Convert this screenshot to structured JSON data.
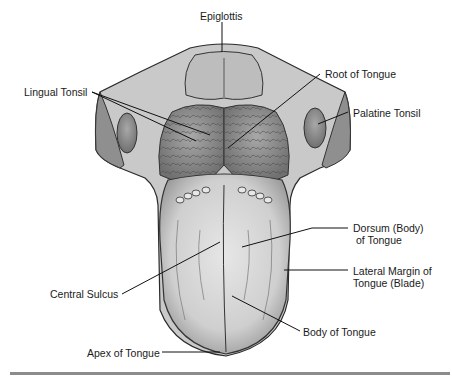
{
  "figure": {
    "labels": [
      {
        "id": "epiglottis",
        "text": "Epiglottis",
        "x": 200,
        "y": 17
      },
      {
        "id": "lingual-tonsil",
        "text": "Lingual Tonsil",
        "x": 24,
        "y": 86
      },
      {
        "id": "root-of-tongue",
        "text": "Root of Tongue",
        "x": 325,
        "y": 68
      },
      {
        "id": "palatine-tonsil",
        "text": "Palatine Tonsil",
        "x": 353,
        "y": 107
      },
      {
        "id": "dorsum",
        "text": "Dorsum (Body)\n of Tongue",
        "x": 353,
        "y": 222
      },
      {
        "id": "lateral-margin",
        "text": "Lateral Margin of\nTongue (Blade)",
        "x": 353,
        "y": 265
      },
      {
        "id": "central-sulcus",
        "text": "Central Sulcus",
        "x": 50,
        "y": 288
      },
      {
        "id": "body-of-tongue",
        "text": "Body of Tongue",
        "x": 303,
        "y": 326
      },
      {
        "id": "apex-of-tongue",
        "text": "Apex of Tongue",
        "x": 87,
        "y": 347
      }
    ]
  },
  "colors": {
    "line": "#111111",
    "tissue_light": "#d9d9d9",
    "tissue_mid": "#b5b5b5",
    "tissue_dark": "#6e6e6e",
    "rule": "#8c8c8c"
  }
}
